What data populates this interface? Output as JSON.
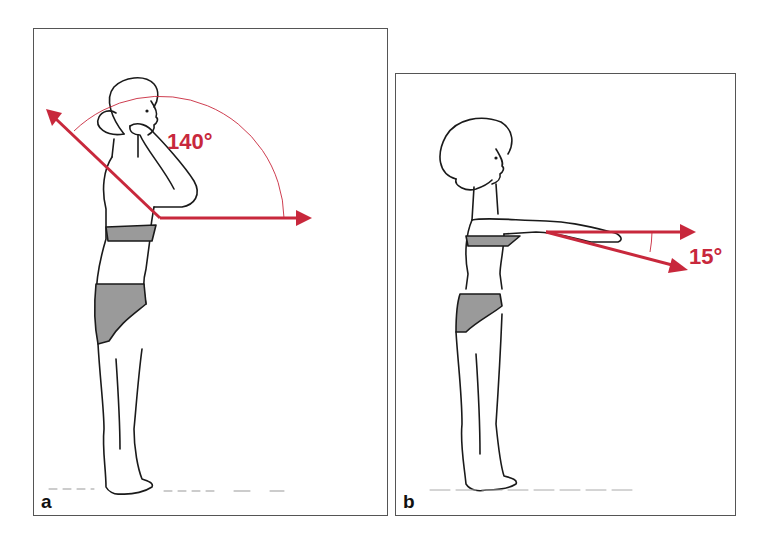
{
  "figure": {
    "accent_color": "#c8283c",
    "line_color": "#1a1a1a",
    "panels": [
      {
        "id": "a",
        "letter": "a",
        "angle_label": "140°",
        "angle_degrees": 140,
        "description": "Standing figure, side view, hand raised behind head; arrows show 140° range from horizontal"
      },
      {
        "id": "b",
        "letter": "b",
        "angle_label": "15°",
        "angle_degrees": 15,
        "description": "Standing figure, side view, arms extended forward; arrows show 15° downward deviation from horizontal"
      }
    ]
  }
}
